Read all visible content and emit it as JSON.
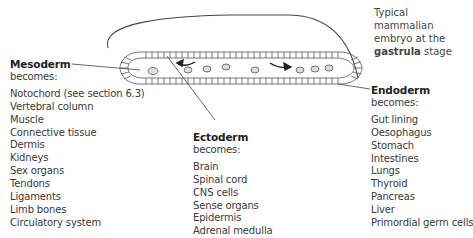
{
  "caption": {
    "line1": "Typical mammalian",
    "line2": "embryo at the",
    "bold": "gastrula",
    "rest": " stage"
  },
  "germ_layers": {
    "mesoderm": {
      "title": "Mesoderm",
      "subtitle": "becomes:",
      "items": [
        "Notochord (see section 6.3)",
        "Vertebral column",
        "Muscle",
        "Connective tissue",
        "Dermis",
        "Kidneys",
        "Sex organs",
        "Tendons",
        "Ligaments",
        "Limb bones",
        "Circulatory system"
      ]
    },
    "ectoderm": {
      "title": "Ectoderm",
      "subtitle": "becomes:",
      "items": [
        "Brain",
        "Spinal cord",
        "CNS cells",
        "Sense organs",
        "Epidermis",
        "Adrenal medulla"
      ]
    },
    "endoderm": {
      "title": "Endoderm",
      "subtitle": "becomes:",
      "items": [
        "Gut lining",
        "Oesophagus",
        "Stomach",
        "Intestines",
        "Lungs",
        "Thyroid",
        "Pancreas",
        "Liver",
        "Primordial germ cells"
      ]
    }
  },
  "colors": {
    "line": "#444444",
    "text": "#3a3a3a",
    "title": "#222222"
  }
}
